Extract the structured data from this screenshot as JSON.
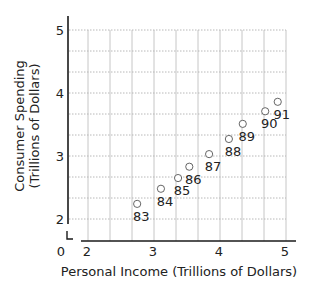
{
  "chart_data": {
    "type": "scatter",
    "title": "",
    "xlabel": "Personal Income (Trillions of Dollars)",
    "ylabel_lines": [
      "Consumer Spending",
      "(Trillions of Dollars)"
    ],
    "ylabel": "Consumer Spending (Trillions of Dollars)",
    "xlim": [
      2,
      5
    ],
    "ylim": [
      2,
      5
    ],
    "x_ticks": [
      "2",
      "3",
      "4",
      "5"
    ],
    "y_ticks": [
      "2",
      "3",
      "4",
      "5"
    ],
    "origin_label": "0",
    "axis_break": true,
    "grid": true,
    "grid_step": 0.3333,
    "points": [
      {
        "label": "83",
        "x": 2.76,
        "y": 2.24
      },
      {
        "label": "84",
        "x": 3.12,
        "y": 2.48
      },
      {
        "label": "85",
        "x": 3.38,
        "y": 2.65
      },
      {
        "label": "86",
        "x": 3.55,
        "y": 2.83
      },
      {
        "label": "87",
        "x": 3.85,
        "y": 3.03
      },
      {
        "label": "88",
        "x": 4.15,
        "y": 3.27
      },
      {
        "label": "89",
        "x": 4.36,
        "y": 3.51
      },
      {
        "label": "90",
        "x": 4.7,
        "y": 3.71
      },
      {
        "label": "91",
        "x": 4.89,
        "y": 3.86
      }
    ],
    "colors": {
      "axis": "#1a1a1a",
      "grid": "#b8b8b8",
      "marker": "#555555",
      "text": "#222222"
    }
  }
}
